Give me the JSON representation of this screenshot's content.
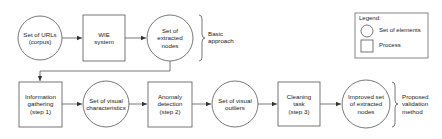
{
  "diagram": {
    "top_row": {
      "nodes": [
        {
          "id": "urls",
          "shape": "circle",
          "label": "Set of URLs\n(corpus)"
        },
        {
          "id": "wie",
          "shape": "box",
          "label": "WIE\nsystem"
        },
        {
          "id": "extracted",
          "shape": "circle",
          "label": "Set of\nextracted\nnodes"
        }
      ],
      "brace_label": "Basic\napproach"
    },
    "bottom_row": {
      "nodes": [
        {
          "id": "info",
          "shape": "box",
          "label": "Information\ngathering\n(step 1)"
        },
        {
          "id": "visual_chars",
          "shape": "circle",
          "label": "Set of visual\ncharacteristics"
        },
        {
          "id": "anomaly",
          "shape": "box",
          "label": "Anomaly\ndetection\n(step 2)"
        },
        {
          "id": "outliers",
          "shape": "circle",
          "label": "Set of visual\noutliers"
        },
        {
          "id": "cleaning",
          "shape": "box",
          "label": "Cleaning\ntask\n(step 3)"
        },
        {
          "id": "improved",
          "shape": "circle",
          "label": "Improved set\nof extracted\nnodes"
        }
      ],
      "brace_label": "Proposed\nvalidation\nmethod"
    },
    "edges": [
      [
        "urls",
        "wie"
      ],
      [
        "wie",
        "extracted"
      ],
      [
        "extracted",
        "info"
      ],
      [
        "info",
        "visual_chars"
      ],
      [
        "visual_chars",
        "anomaly"
      ],
      [
        "anomaly",
        "outliers"
      ],
      [
        "outliers",
        "cleaning"
      ],
      [
        "cleaning",
        "improved"
      ]
    ],
    "legend": {
      "title": "Legend:",
      "items": [
        {
          "shape": "circle",
          "label": "Set of elements"
        },
        {
          "shape": "box",
          "label": "Process"
        }
      ]
    },
    "colors": {
      "stroke": "#555555",
      "text": "#222222",
      "background": "#ffffff"
    }
  }
}
